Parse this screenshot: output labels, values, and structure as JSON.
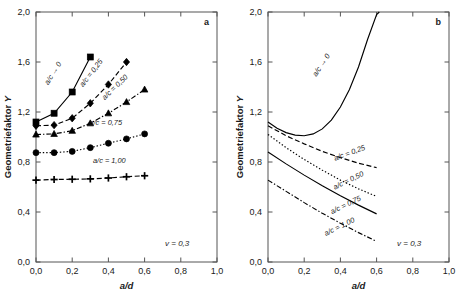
{
  "figure": {
    "background_color": "#ffffff",
    "axis_color": "#555555",
    "curve_color": "#000000"
  },
  "chart_data": [
    {
      "type": "scatter",
      "panel": "a",
      "panel_letter": "a",
      "title": "",
      "xlabel": "a/d",
      "ylabel": "Geometriefaktor Y",
      "xlim": [
        0.0,
        1.0
      ],
      "ylim": [
        0.0,
        2.0
      ],
      "xticks": [
        0.0,
        0.2,
        0.4,
        0.6,
        0.8,
        1.0
      ],
      "xticklabels": [
        "0,0",
        "0,2",
        "0,4",
        "0,6",
        "0,8",
        "1,0"
      ],
      "yticks": [
        0.0,
        0.4,
        0.8,
        1.2,
        1.6,
        2.0
      ],
      "yticklabels": [
        "0,0",
        "0,4",
        "0,8",
        "1,2",
        "1,6",
        "2,0"
      ],
      "grid": false,
      "legend_position": "inline-curve-labels",
      "annotations": [
        {
          "text": "v = 0,3",
          "x": 0.78,
          "y": 0.13
        }
      ],
      "series": [
        {
          "name": "a/c → 0",
          "label": "a/c → 0",
          "marker": "square",
          "linestyle": "solid",
          "label_x": 0.105,
          "label_y": 1.5,
          "label_angle": -58,
          "x": [
            0.0,
            0.1,
            0.2,
            0.3
          ],
          "values": [
            1.12,
            1.19,
            1.36,
            1.64
          ]
        },
        {
          "name": "a/c = 0,25",
          "label": "a/c = 0,25",
          "marker": "diamond",
          "linestyle": "dashed",
          "label_x": 0.315,
          "label_y": 1.5,
          "label_angle": -52,
          "x": [
            0.0,
            0.1,
            0.2,
            0.3,
            0.4,
            0.5
          ],
          "values": [
            1.09,
            1.095,
            1.15,
            1.27,
            1.42,
            1.6
          ]
        },
        {
          "name": "a/c = 0,50",
          "label": "a/c = 0,50",
          "marker": "triangle",
          "linestyle": "dashdot",
          "label_x": 0.445,
          "label_y": 1.385,
          "label_angle": -44,
          "x": [
            0.0,
            0.1,
            0.2,
            0.3,
            0.4,
            0.5,
            0.6
          ],
          "values": [
            1.02,
            1.025,
            1.05,
            1.11,
            1.19,
            1.28,
            1.38
          ]
        },
        {
          "name": "a/c = 0,75",
          "label": "a/c = 0,75",
          "marker": "circle",
          "linestyle": "dotted",
          "label_x": 0.385,
          "label_y": 1.095,
          "label_angle": 0,
          "x": [
            0.0,
            0.1,
            0.2,
            0.3,
            0.4,
            0.5,
            0.6
          ],
          "values": [
            0.875,
            0.875,
            0.885,
            0.915,
            0.95,
            0.985,
            1.025
          ]
        },
        {
          "name": "a/c = 1,00",
          "label": "a/c = 1,00",
          "marker": "plus",
          "linestyle": "dashed",
          "label_x": 0.405,
          "label_y": 0.795,
          "label_angle": 0,
          "x": [
            0.0,
            0.1,
            0.2,
            0.3,
            0.4,
            0.5,
            0.6
          ],
          "values": [
            0.655,
            0.66,
            0.662,
            0.665,
            0.672,
            0.682,
            0.69
          ]
        }
      ]
    },
    {
      "type": "line",
      "panel": "b",
      "panel_letter": "b",
      "title": "",
      "xlabel": "a/d",
      "ylabel": "Geometriefaktor Y",
      "xlim": [
        0.0,
        1.0
      ],
      "ylim": [
        0.0,
        2.0
      ],
      "xticks": [
        0.0,
        0.2,
        0.4,
        0.6,
        0.8,
        1.0
      ],
      "xticklabels": [
        "0,0",
        "0,2",
        "0,4",
        "0,6",
        "0,8",
        "1,0"
      ],
      "yticks": [
        0.0,
        0.4,
        0.8,
        1.2,
        1.6,
        2.0
      ],
      "yticklabels": [
        "0,0",
        "0,4",
        "0,8",
        "1,2",
        "1,6",
        "2,0"
      ],
      "grid": false,
      "legend_position": "inline-curve-labels",
      "annotations": [
        {
          "text": "v = 0,3",
          "x": 0.78,
          "y": 0.13
        }
      ],
      "series": [
        {
          "name": "a/c → 0",
          "label": "a/c → 0",
          "marker": "none",
          "linestyle": "solid",
          "label_x": 0.305,
          "label_y": 1.565,
          "label_angle": -57,
          "x": [
            0.0,
            0.05,
            0.1,
            0.15,
            0.2,
            0.25,
            0.3,
            0.35,
            0.4,
            0.45,
            0.5,
            0.55,
            0.6,
            0.615
          ],
          "values": [
            1.12,
            1.07,
            1.035,
            1.015,
            1.01,
            1.025,
            1.065,
            1.135,
            1.24,
            1.38,
            1.56,
            1.78,
            1.98,
            2.0
          ]
        },
        {
          "name": "a/c = 0,25",
          "label": "a/c = 0,25",
          "marker": "none",
          "linestyle": "dashed",
          "label_x": 0.455,
          "label_y": 0.855,
          "label_angle": -20,
          "x": [
            0.0,
            0.1,
            0.2,
            0.3,
            0.4,
            0.5,
            0.6
          ],
          "values": [
            1.09,
            1.01,
            0.945,
            0.885,
            0.835,
            0.79,
            0.755
          ]
        },
        {
          "name": "a/c = 0,50",
          "label": "a/c = 0,50",
          "marker": "none",
          "linestyle": "dotted",
          "label_x": 0.45,
          "label_y": 0.635,
          "label_angle": -26,
          "x": [
            0.0,
            0.1,
            0.2,
            0.3,
            0.4,
            0.5,
            0.6
          ],
          "values": [
            1.02,
            0.915,
            0.82,
            0.735,
            0.655,
            0.585,
            0.525
          ]
        },
        {
          "name": "a/c = 0,75",
          "label": "a/c = 0,75",
          "marker": "none",
          "linestyle": "solid",
          "label_x": 0.435,
          "label_y": 0.44,
          "label_angle": -26,
          "x": [
            0.0,
            0.1,
            0.2,
            0.3,
            0.4,
            0.5,
            0.6
          ],
          "values": [
            0.88,
            0.785,
            0.695,
            0.61,
            0.53,
            0.455,
            0.385
          ]
        },
        {
          "name": "a/c = 1,00",
          "label": "a/c = 1,00",
          "marker": "none",
          "linestyle": "dashdot",
          "label_x": 0.4,
          "label_y": 0.265,
          "label_angle": -26,
          "x": [
            0.0,
            0.1,
            0.2,
            0.3,
            0.4,
            0.5,
            0.6
          ],
          "values": [
            0.655,
            0.565,
            0.475,
            0.39,
            0.31,
            0.235,
            0.165
          ]
        }
      ]
    }
  ]
}
